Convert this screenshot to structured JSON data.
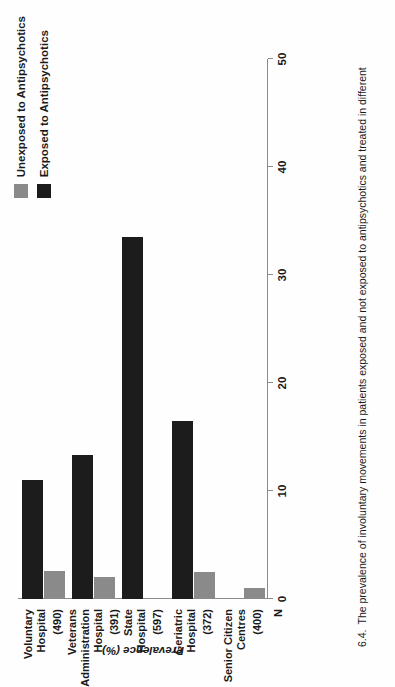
{
  "figure": {
    "caption_number": "6.4.",
    "caption_text": "The prevalence of involuntary movements in patients exposed and not exposed to antipsychotics and treated in different"
  },
  "legend": {
    "position": "top-right",
    "items": [
      {
        "label": "Unexposed to Antipsychotics",
        "color": "#8a8a8a",
        "swatch": "light-grey-swatch"
      },
      {
        "label": "Exposed to Antipsychotics",
        "color": "#1c1c1c",
        "swatch": "black-swatch"
      }
    ]
  },
  "axes": {
    "ylabel": "Prevalence (%)",
    "n_label": "N",
    "ticks": [
      "0",
      "10",
      "20",
      "30",
      "40",
      "50"
    ]
  },
  "chart_data": {
    "type": "bar",
    "title": "",
    "xlabel": "",
    "ylabel": "Prevalence (%)",
    "ylim": [
      0,
      50
    ],
    "grid": false,
    "legend_position": "top-right",
    "categories": [
      "Voluntary Hospital",
      "Veterans Administration Hospital",
      "State Hospital",
      "Geriatric Hospital",
      "Senior Citizen Centres"
    ],
    "category_lines": [
      [
        "Voluntary",
        "Hospital"
      ],
      [
        "Veterans",
        "Administration",
        "Hospital"
      ],
      [
        "State",
        "Hospital"
      ],
      [
        "Geriatric",
        "Hospital"
      ],
      [
        "Senior Citizen",
        "Centres"
      ]
    ],
    "n": [
      "(490)",
      "(391)",
      "(597)",
      "(372)",
      "(400)"
    ],
    "series": [
      {
        "name": "Unexposed to Antipsychotics",
        "color": "#8a8a8a",
        "values": [
          2.6,
          2.0,
          0.0,
          2.5,
          1.0
        ]
      },
      {
        "name": "Exposed to Antipsychotics",
        "color": "#1c1c1c",
        "values": [
          11.0,
          13.3,
          33.5,
          16.5,
          0.0
        ]
      }
    ]
  }
}
